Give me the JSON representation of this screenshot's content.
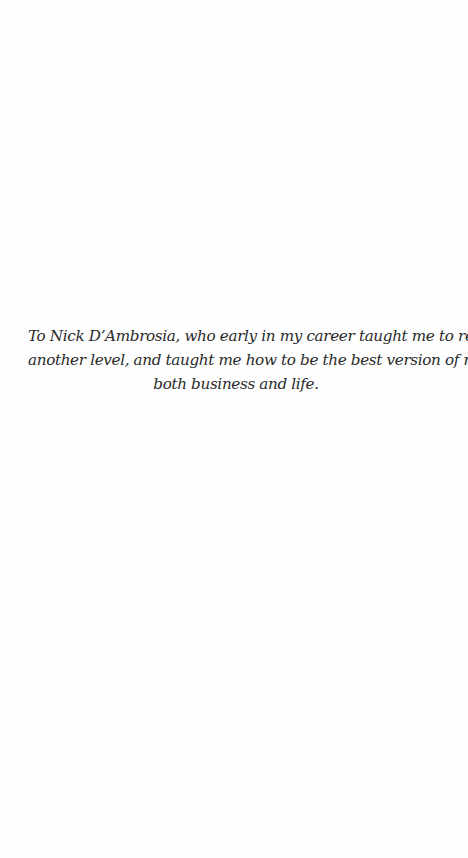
{
  "page": {
    "background": "#fefefe",
    "text_color": "#2a2a2a"
  },
  "dedication": {
    "lines": [
      "To Nick D’Ambrosia, who early in my career taught me to reach for",
      "another level, and taught me how to be the best version of myself in",
      "both business and life."
    ]
  }
}
